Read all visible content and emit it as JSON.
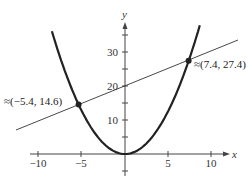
{
  "chart_data": {
    "type": "line",
    "title": "",
    "xlabel": "x",
    "ylabel": "y",
    "xlim": [
      -11,
      12
    ],
    "ylim": [
      -4,
      38
    ],
    "grid": false,
    "x_ticks": [
      -10,
      -5,
      5,
      10
    ],
    "x_tick_labels": [
      "−10",
      "−5",
      "5",
      "10"
    ],
    "y_ticks": [
      10,
      20,
      30
    ],
    "y_tick_labels": [
      "10",
      "20",
      "30"
    ],
    "series": [
      {
        "name": "parabola",
        "equation": "y = 0.5x^2",
        "style": "thick",
        "x_range": [
          -8.5,
          8.7
        ]
      },
      {
        "name": "line",
        "equation": "y = x + 20",
        "style": "thin",
        "x_range": [
          -10.5,
          13
        ]
      }
    ],
    "points": [
      {
        "x": -5.4,
        "y": 14.6,
        "label": "≈(−5.4, 14.6)"
      },
      {
        "x": 7.4,
        "y": 27.4,
        "label": "≈(7.4, 27.4)"
      }
    ]
  },
  "labels": {
    "x_axis": "x",
    "y_axis": "y",
    "tick_x_m10": "−10",
    "tick_x_m5": "−5",
    "tick_x_5": "5",
    "tick_x_10": "10",
    "tick_y_10": "10",
    "tick_y_20": "20",
    "tick_y_30": "30",
    "point_left": "≈(−5.4, 14.6)",
    "point_right": "≈(7.4, 27.4)"
  }
}
